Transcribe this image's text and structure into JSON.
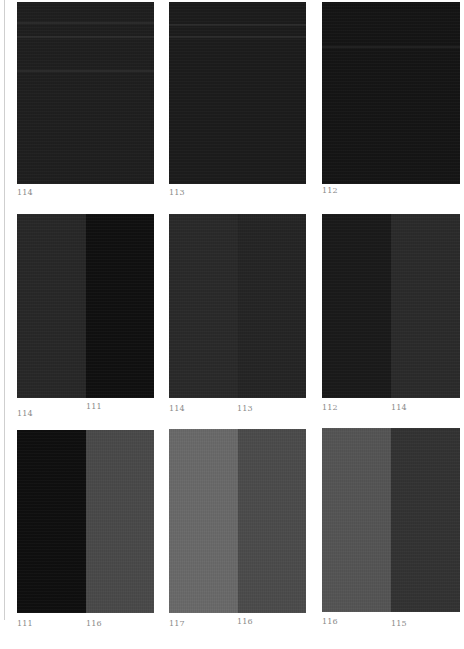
{
  "page": {
    "rows": [
      {
        "panels": [
          {
            "swatches": [
              {
                "color": "#1f1f1f"
              }
            ],
            "labels": [
              "114"
            ]
          },
          {
            "swatches": [
              {
                "color": "#1c1c1c"
              }
            ],
            "labels": [
              "113"
            ]
          },
          {
            "swatches": [
              {
                "color": "#151515"
              }
            ],
            "labels": [
              "112"
            ]
          }
        ]
      },
      {
        "panels": [
          {
            "swatches": [
              {
                "color": "#282828"
              },
              {
                "color": "#101010"
              }
            ],
            "labels": [
              "114",
              "111"
            ]
          },
          {
            "swatches": [
              {
                "color": "#2a2a2a"
              },
              {
                "color": "#252525"
              }
            ],
            "labels": [
              "114",
              "113"
            ]
          },
          {
            "swatches": [
              {
                "color": "#1a1a1a"
              },
              {
                "color": "#2b2b2b"
              }
            ],
            "labels": [
              "112",
              "114"
            ]
          }
        ]
      },
      {
        "panels": [
          {
            "swatches": [
              {
                "color": "#0f0f0f"
              },
              {
                "color": "#4a4a4a"
              }
            ],
            "labels": [
              "111",
              "116"
            ]
          },
          {
            "swatches": [
              {
                "color": "#6a6a6a"
              },
              {
                "color": "#4c4c4c"
              }
            ],
            "labels": [
              "117",
              "116"
            ]
          },
          {
            "swatches": [
              {
                "color": "#555555"
              },
              {
                "color": "#333333"
              }
            ],
            "labels": [
              "116",
              "115"
            ]
          }
        ]
      }
    ]
  }
}
